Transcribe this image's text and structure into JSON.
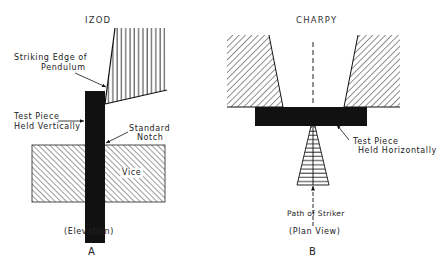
{
  "izod": {
    "title": "IZOD",
    "labels": {
      "striking_edge_line1": "Striking Edge of",
      "striking_edge_line2": "Pendulum",
      "test_piece_line1": "Test Piece",
      "test_piece_line2": "Held Vertically",
      "notch_line1": "Standard",
      "notch_line2": "Notch",
      "vice": "Vice"
    },
    "view": "(Elevation)",
    "letter": "A"
  },
  "charpy": {
    "title": "CHARPY",
    "labels": {
      "test_piece_line1": "Test Piece",
      "test_piece_line2": "Held Horizontally",
      "path_of_striker": "Path of Striker"
    },
    "view": "(Plan View)",
    "letter": "B"
  },
  "colors": {
    "ink": "#111111",
    "background": "#ffffff"
  }
}
